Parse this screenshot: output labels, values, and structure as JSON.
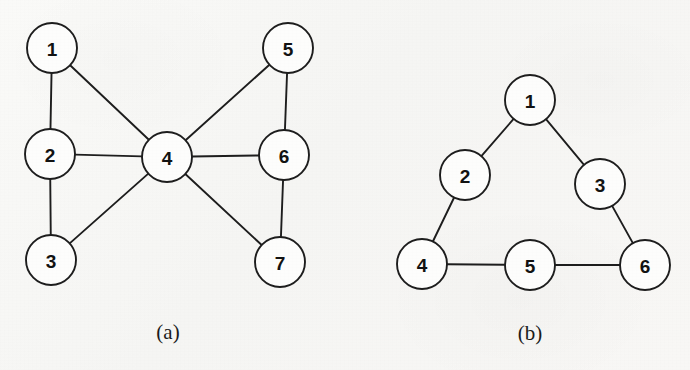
{
  "figure": {
    "background_color": "#f7f7f5",
    "ink_color": "#1d1d1d",
    "node_fill_color": "#fdfdfc"
  },
  "chart_data": {
    "type": "diagram",
    "diagram_kind": "undirected-graph",
    "title": "",
    "panels": [
      {
        "id": "a",
        "caption": "(a)",
        "caption_x": 168,
        "caption_y": 332,
        "node_count": 7,
        "edge_count": 9,
        "nodes": [
          {
            "id": "a1",
            "label": "1",
            "cx": 52,
            "cy": 48,
            "r": 25
          },
          {
            "id": "a2",
            "label": "2",
            "cx": 50,
            "cy": 154,
            "r": 25
          },
          {
            "id": "a3",
            "label": "3",
            "cx": 51,
            "cy": 260,
            "r": 25
          },
          {
            "id": "a4",
            "label": "4",
            "cx": 167,
            "cy": 157,
            "r": 25
          },
          {
            "id": "a5",
            "label": "5",
            "cx": 288,
            "cy": 48,
            "r": 25
          },
          {
            "id": "a6",
            "label": "6",
            "cx": 284,
            "cy": 155,
            "r": 25
          },
          {
            "id": "a7",
            "label": "7",
            "cx": 280,
            "cy": 262,
            "r": 25
          }
        ],
        "edges": [
          {
            "source": "a1",
            "target": "a2",
            "label": "1-2"
          },
          {
            "source": "a1",
            "target": "a4",
            "label": "1-4"
          },
          {
            "source": "a2",
            "target": "a3",
            "label": "2-3"
          },
          {
            "source": "a2",
            "target": "a4",
            "label": "2-4"
          },
          {
            "source": "a3",
            "target": "a4",
            "label": "3-4"
          },
          {
            "source": "a4",
            "target": "a5",
            "label": "4-5"
          },
          {
            "source": "a4",
            "target": "a6",
            "label": "4-6"
          },
          {
            "source": "a4",
            "target": "a7",
            "label": "4-7"
          },
          {
            "source": "a5",
            "target": "a6",
            "label": "5-6"
          },
          {
            "source": "a6",
            "target": "a7",
            "label": "6-7"
          }
        ]
      },
      {
        "id": "b",
        "caption": "(b)",
        "caption_x": 530,
        "caption_y": 333,
        "node_count": 6,
        "edge_count": 5,
        "nodes": [
          {
            "id": "b1",
            "label": "1",
            "cx": 530,
            "cy": 100,
            "r": 25
          },
          {
            "id": "b2",
            "label": "2",
            "cx": 465,
            "cy": 175,
            "r": 25
          },
          {
            "id": "b3",
            "label": "3",
            "cx": 600,
            "cy": 184,
            "r": 25
          },
          {
            "id": "b4",
            "label": "4",
            "cx": 422,
            "cy": 264,
            "r": 25
          },
          {
            "id": "b5",
            "label": "5",
            "cx": 530,
            "cy": 265,
            "r": 25
          },
          {
            "id": "b6",
            "label": "6",
            "cx": 645,
            "cy": 265,
            "r": 25
          }
        ],
        "edges": [
          {
            "source": "b1",
            "target": "b2",
            "label": "1-2"
          },
          {
            "source": "b1",
            "target": "b3",
            "label": "1-3"
          },
          {
            "source": "b2",
            "target": "b4",
            "label": "2-4"
          },
          {
            "source": "b3",
            "target": "b6",
            "label": "3-6"
          },
          {
            "source": "b4",
            "target": "b5",
            "label": "4-5"
          },
          {
            "source": "b5",
            "target": "b6",
            "label": "5-6"
          }
        ]
      }
    ]
  }
}
